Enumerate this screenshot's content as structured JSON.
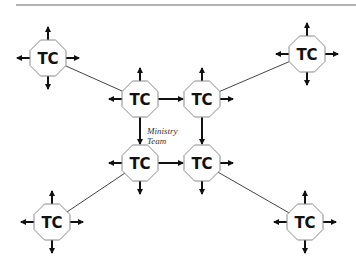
{
  "diagram": {
    "node_label": "TC",
    "center_label_line1": "Ministry",
    "center_label_line2": "Team",
    "colors": {
      "node_stroke": "#8a8a8a",
      "arrow": "#111111",
      "link": "#444444",
      "rule": "#999999"
    },
    "nodes": [
      {
        "id": "tl",
        "label": "TC",
        "x": 48,
        "y": 58
      },
      {
        "id": "tr",
        "label": "TC",
        "x": 307,
        "y": 54
      },
      {
        "id": "ctl",
        "label": "TC",
        "x": 140,
        "y": 99
      },
      {
        "id": "ctr",
        "label": "TC",
        "x": 202,
        "y": 99
      },
      {
        "id": "cbl",
        "label": "TC",
        "x": 140,
        "y": 163
      },
      {
        "id": "cbr",
        "label": "TC",
        "x": 202,
        "y": 163
      },
      {
        "id": "bl",
        "label": "TC",
        "x": 52,
        "y": 222
      },
      {
        "id": "br",
        "label": "TC",
        "x": 305,
        "y": 222
      }
    ],
    "links": [
      [
        "tl",
        "ctl"
      ],
      [
        "tr",
        "ctr"
      ],
      [
        "bl",
        "cbl"
      ],
      [
        "br",
        "cbr"
      ],
      [
        "ctl",
        "ctr"
      ],
      [
        "cbl",
        "cbr"
      ],
      [
        "ctl",
        "cbl"
      ],
      [
        "ctr",
        "cbr"
      ]
    ]
  }
}
